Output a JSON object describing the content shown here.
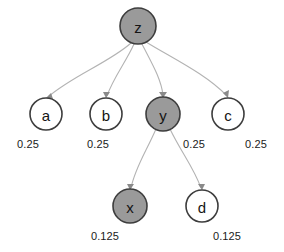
{
  "diagram": {
    "type": "tree",
    "title": "",
    "nodes": [
      {
        "id": "z",
        "label": "z",
        "shaded": true,
        "cx": 138,
        "cy": 26,
        "r": 18
      },
      {
        "id": "a",
        "label": "a",
        "shaded": false,
        "cx": 46,
        "cy": 114,
        "r": 16
      },
      {
        "id": "b",
        "label": "b",
        "shaded": false,
        "cx": 106,
        "cy": 114,
        "r": 16
      },
      {
        "id": "y",
        "label": "y",
        "shaded": true,
        "cx": 163,
        "cy": 114,
        "r": 17
      },
      {
        "id": "c",
        "label": "c",
        "shaded": false,
        "cx": 228,
        "cy": 114,
        "r": 16
      },
      {
        "id": "x",
        "label": "x",
        "shaded": true,
        "cx": 130,
        "cy": 206,
        "r": 17
      },
      {
        "id": "d",
        "label": "d",
        "shaded": false,
        "cx": 202,
        "cy": 206,
        "r": 16
      }
    ],
    "edges": [
      {
        "from": "z",
        "to": "a"
      },
      {
        "from": "z",
        "to": "b"
      },
      {
        "from": "z",
        "to": "y"
      },
      {
        "from": "z",
        "to": "c"
      },
      {
        "from": "y",
        "to": "x"
      },
      {
        "from": "y",
        "to": "d"
      }
    ],
    "weights": [
      {
        "node": "a",
        "value": "0.25",
        "x": 28,
        "y": 138
      },
      {
        "node": "b",
        "value": "0.25",
        "x": 98,
        "y": 138
      },
      {
        "node": "y",
        "value": "0.25",
        "x": 194,
        "y": 138
      },
      {
        "node": "c",
        "value": "0.25",
        "x": 256,
        "y": 138
      },
      {
        "node": "x",
        "value": "0.125",
        "x": 105,
        "y": 230
      },
      {
        "node": "d",
        "value": "0.125",
        "x": 227,
        "y": 230
      }
    ],
    "colors": {
      "shaded_fill": "#9a9a9a",
      "open_fill": "#ffffff",
      "node_stroke": "#3d3d3d",
      "edge_stroke": "#b3b3b3",
      "text": "#141414",
      "background": "#ffffff"
    }
  }
}
